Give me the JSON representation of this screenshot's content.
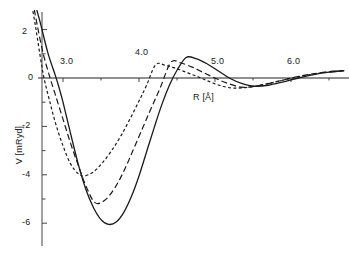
{
  "figure": {
    "name": "interatomic-potential-curves",
    "background": "#ffffff",
    "line_color": "#1a1a1a"
  },
  "axes": {
    "x": {
      "label": "R [Å]",
      "ticks": [
        3.0,
        4.0,
        5.0,
        6.0
      ],
      "tick_labels": [
        "3.0",
        "4.0",
        "5.0",
        "6.0"
      ],
      "minor_ticks": [
        3.5,
        4.5,
        5.5,
        6.5
      ],
      "range": [
        2.58,
        6.7
      ],
      "axis_line_at_y": 0
    },
    "y": {
      "label": "V [mRyd]",
      "ticks": [
        2,
        0,
        -2,
        -4,
        -6
      ],
      "tick_labels": [
        "2",
        "0",
        "-2",
        "-4",
        "-6"
      ],
      "minor_ticks": [
        3,
        1,
        -1,
        -3,
        -5,
        -7
      ],
      "range": [
        -7.0,
        3.2
      ]
    },
    "grid": false,
    "legend": null
  },
  "chart_data": {
    "type": "line",
    "title": "",
    "xlabel": "R [Å]",
    "ylabel": "V [mRyd]",
    "xlim": [
      2.58,
      6.7
    ],
    "ylim": [
      -7.0,
      3.2
    ],
    "grid": false,
    "legend_position": "none",
    "series": [
      {
        "name": "solid-curve",
        "style": "solid",
        "color": "#1a1a1a",
        "zero_crossing": 2.95,
        "minimum": {
          "x": 3.6,
          "y": -6.05
        },
        "maximum": {
          "x": 4.62,
          "y": 0.85
        },
        "second_minimum": {
          "x": 5.52,
          "y": -0.34
        },
        "x": [
          2.62,
          2.7,
          2.8,
          2.9,
          2.95,
          3.0,
          3.1,
          3.2,
          3.3,
          3.4,
          3.5,
          3.6,
          3.7,
          3.8,
          3.9,
          4.0,
          4.1,
          4.2,
          4.3,
          4.4,
          4.5,
          4.62,
          4.75,
          4.9,
          5.05,
          5.2,
          5.35,
          5.52,
          5.7,
          5.9,
          6.1,
          6.3,
          6.5,
          6.7
        ],
        "y": [
          3.2,
          2.3,
          1.05,
          0.1,
          -0.42,
          -1.0,
          -2.3,
          -3.55,
          -4.6,
          -5.35,
          -5.85,
          -6.05,
          -5.95,
          -5.55,
          -4.9,
          -4.05,
          -3.05,
          -2.05,
          -1.1,
          -0.3,
          0.32,
          0.85,
          0.8,
          0.58,
          0.28,
          -0.02,
          -0.22,
          -0.34,
          -0.3,
          -0.16,
          0.0,
          0.14,
          0.24,
          0.3
        ]
      },
      {
        "name": "long-dashed-curve",
        "style": "dashed",
        "color": "#1a1a1a",
        "zero_crossing": 2.83,
        "minimum": {
          "x": 3.42,
          "y": -5.15
        },
        "maximum": {
          "x": 4.42,
          "y": 0.65
        },
        "second_minimum": {
          "x": 5.35,
          "y": -0.38
        },
        "x": [
          2.6,
          2.66,
          2.74,
          2.83,
          2.9,
          3.0,
          3.1,
          3.2,
          3.3,
          3.42,
          3.55,
          3.68,
          3.8,
          3.92,
          4.05,
          4.16,
          4.28,
          4.42,
          4.55,
          4.7,
          4.85,
          5.0,
          5.15,
          5.35,
          5.55,
          5.75,
          5.95,
          6.15,
          6.35,
          6.55,
          6.7
        ],
        "y": [
          3.2,
          2.2,
          1.0,
          0.0,
          -0.7,
          -1.7,
          -2.7,
          -3.6,
          -4.45,
          -5.15,
          -5.05,
          -4.55,
          -3.85,
          -3.0,
          -2.05,
          -1.25,
          -0.4,
          0.65,
          0.62,
          0.45,
          0.22,
          0.0,
          -0.2,
          -0.38,
          -0.33,
          -0.2,
          -0.04,
          0.1,
          0.2,
          0.28,
          0.31
        ]
      },
      {
        "name": "short-dashed-curve",
        "style": "dotted-dashed",
        "color": "#1a1a1a",
        "zero_crossing": 2.75,
        "minimum": {
          "x": 3.28,
          "y": -4.05
        },
        "maximum": {
          "x": 4.22,
          "y": 0.55
        },
        "second_minimum": {
          "x": 5.25,
          "y": -0.42
        },
        "x": [
          2.58,
          2.64,
          2.7,
          2.75,
          2.82,
          2.9,
          3.0,
          3.1,
          3.2,
          3.28,
          3.4,
          3.52,
          3.64,
          3.76,
          3.88,
          4.0,
          4.1,
          4.22,
          4.35,
          4.5,
          4.65,
          4.8,
          4.95,
          5.1,
          5.25,
          5.45,
          5.65,
          5.85,
          6.05,
          6.25,
          6.45,
          6.7
        ],
        "y": [
          3.2,
          2.1,
          0.9,
          0.0,
          -0.9,
          -1.85,
          -2.8,
          -3.55,
          -3.95,
          -4.05,
          -3.88,
          -3.5,
          -3.0,
          -2.4,
          -1.7,
          -0.95,
          -0.3,
          0.55,
          0.52,
          0.38,
          0.2,
          0.02,
          -0.18,
          -0.34,
          -0.42,
          -0.38,
          -0.26,
          -0.12,
          0.02,
          0.14,
          0.23,
          0.31
        ]
      }
    ]
  }
}
